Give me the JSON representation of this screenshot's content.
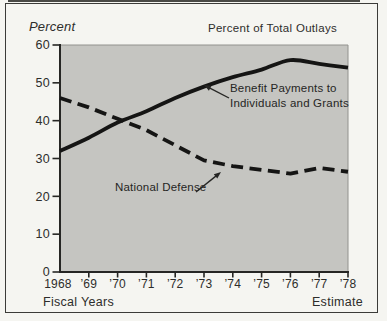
{
  "chart_data": {
    "type": "line",
    "title": "Percent of Total Outlays",
    "ylabel": "Percent",
    "xlabel": "Fiscal Years",
    "x_note": "Estimate",
    "categories": [
      "1968",
      "’69",
      "’70",
      "’71",
      "’72",
      "’73",
      "’74",
      "’75",
      "’76",
      "’77",
      "’78"
    ],
    "ylim": [
      0,
      60
    ],
    "y_ticks": [
      0,
      10,
      20,
      30,
      40,
      50,
      60
    ],
    "grid": false,
    "legend": "inline-annotations",
    "series": [
      {
        "name": "Benefit Payments to Individuals and Grants",
        "style": "solid",
        "values": [
          32,
          35.5,
          39.5,
          42.5,
          46,
          49,
          51.5,
          53.5,
          56,
          55,
          54
        ]
      },
      {
        "name": "National Defense",
        "style": "dashed",
        "values": [
          46,
          43.5,
          40.5,
          37.5,
          33.5,
          29.5,
          28,
          27,
          26,
          27.5,
          26.5
        ]
      }
    ],
    "annotations": [
      {
        "lines": [
          "Benefit Payments to",
          "Individuals and Grants"
        ],
        "points_to": "Benefit Payments to Individuals and Grants"
      },
      {
        "lines": [
          "National Defense"
        ],
        "points_to": "National Defense"
      }
    ],
    "colors": {
      "page_bg": "#f5f5f1",
      "plot_bg": "#c5c5c1",
      "line": "#151514",
      "axis": "#262624",
      "text": "#2d2d2b",
      "frame": "#3b3b38",
      "inner_edge": "#92928e"
    }
  }
}
